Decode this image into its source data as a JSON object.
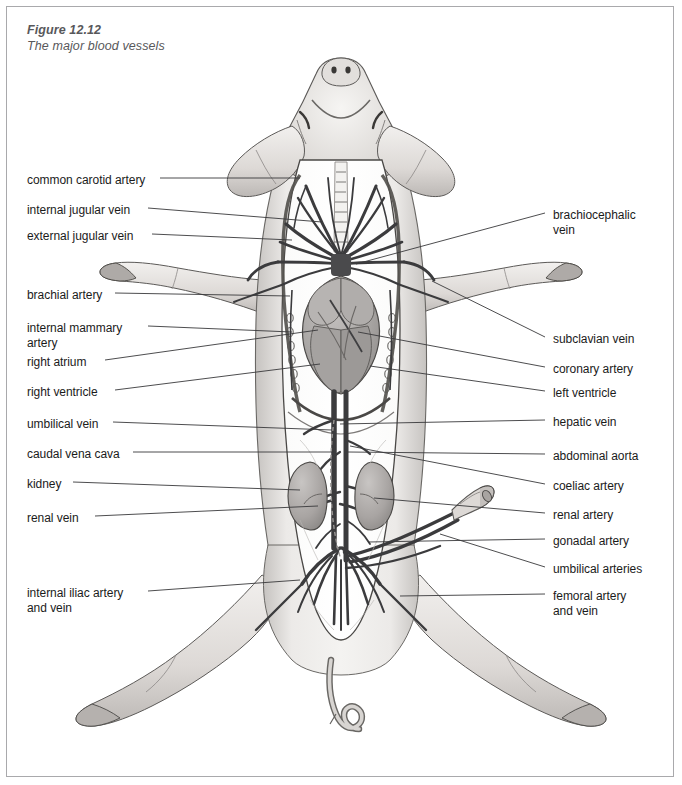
{
  "figure": {
    "number": "Figure 12.12",
    "subtitle": "The major blood vessels"
  },
  "specimen": "fetal pig, ventral view, dissected",
  "colors": {
    "frame_border": "#a9a9ac",
    "caption_text": "#58585b",
    "label_text": "#1b1b1b",
    "leader_line": "#39393b",
    "body_fill": "#efedeb",
    "body_shade": "#c8c5c2",
    "vessel_dark": "#3b3b3d",
    "organ_fill": "#b9b6b4",
    "heart_fill": "#a9a6a4",
    "background": "#ffffff"
  },
  "labels_left": [
    {
      "id": "common-carotid-artery",
      "text": "common carotid artery",
      "x": 27,
      "y": 173,
      "leader_y": 181,
      "leader_x2": 300
    },
    {
      "id": "internal-jugular-vein",
      "text": "internal jugular vein",
      "x": 27,
      "y": 203,
      "leader_y": 211,
      "leader_x2": 322
    },
    {
      "id": "external-jugular-vein",
      "text": "external jugular vein",
      "x": 27,
      "y": 229,
      "leader_y": 237,
      "leader_x2": 290
    },
    {
      "id": "brachial-artery",
      "text": "brachial artery",
      "x": 27,
      "y": 288,
      "leader_y": 296,
      "leader_x2": 300
    },
    {
      "id": "internal-mammary-artery",
      "text": "internal mammary\nartery",
      "x": 27,
      "y": 321,
      "leader_y": 329,
      "leader_x2": 285
    },
    {
      "id": "right-atrium",
      "text": "right atrium",
      "x": 27,
      "y": 355,
      "leader_y": 362,
      "leader_x2": 330
    },
    {
      "id": "right-ventricle",
      "text": "right ventricle",
      "x": 27,
      "y": 385,
      "leader_y": 392,
      "leader_x2": 330
    },
    {
      "id": "umbilical-vein",
      "text": "umbilical vein",
      "x": 27,
      "y": 417,
      "leader_y": 425,
      "leader_x2": 330
    },
    {
      "id": "caudal-vena-cava",
      "text": "caudal vena cava",
      "x": 27,
      "y": 447,
      "leader_y": 455,
      "leader_x2": 332
    },
    {
      "id": "kidney",
      "text": "kidney",
      "x": 27,
      "y": 477,
      "leader_y": 485,
      "leader_x2": 300
    },
    {
      "id": "renal-vein",
      "text": "renal vein",
      "x": 27,
      "y": 511,
      "leader_y": 519,
      "leader_x2": 320
    },
    {
      "id": "internal-iliac-artery-and-vein",
      "text": "internal iliac artery\nand vein",
      "x": 27,
      "y": 586,
      "leader_y": 594,
      "leader_x2": 295
    }
  ],
  "labels_right": [
    {
      "id": "brachiocephalic-vein",
      "text": "brachiocephalic\nvein",
      "x": 553,
      "y": 208,
      "leader_y": 216,
      "leader_x1": 360
    },
    {
      "id": "subclavian-vein",
      "text": "subclavian vein",
      "x": 553,
      "y": 332,
      "leader_y": 340,
      "leader_x1": 430
    },
    {
      "id": "coronary-artery",
      "text": "coronary artery",
      "x": 553,
      "y": 362,
      "leader_y": 369,
      "leader_x1": 360
    },
    {
      "id": "left-ventricle",
      "text": "left ventricle",
      "x": 553,
      "y": 386,
      "leader_y": 394,
      "leader_x1": 370
    },
    {
      "id": "hepatic-vein",
      "text": "hepatic vein",
      "x": 553,
      "y": 415,
      "leader_y": 422,
      "leader_x1": 360
    },
    {
      "id": "abdominal-aorta",
      "text": "abdominal aorta",
      "x": 553,
      "y": 449,
      "leader_y": 456,
      "leader_x1": 350
    },
    {
      "id": "coeliac-artery",
      "text": "coeliac artery",
      "x": 553,
      "y": 479,
      "leader_y": 487,
      "leader_x1": 345
    },
    {
      "id": "renal-artery",
      "text": "renal artery",
      "x": 553,
      "y": 508,
      "leader_y": 516,
      "leader_x1": 350
    },
    {
      "id": "gonadal-artery",
      "text": "gonadal artery",
      "x": 553,
      "y": 534,
      "leader_y": 542,
      "leader_x1": 350
    },
    {
      "id": "umbilical-arteries",
      "text": "umbilical arteries",
      "x": 553,
      "y": 562,
      "leader_y": 570,
      "leader_x1": 350
    },
    {
      "id": "femoral-artery-and-vein",
      "text": "femoral artery\nand vein",
      "x": 553,
      "y": 589,
      "leader_y": 597,
      "leader_x1": 400
    }
  ]
}
